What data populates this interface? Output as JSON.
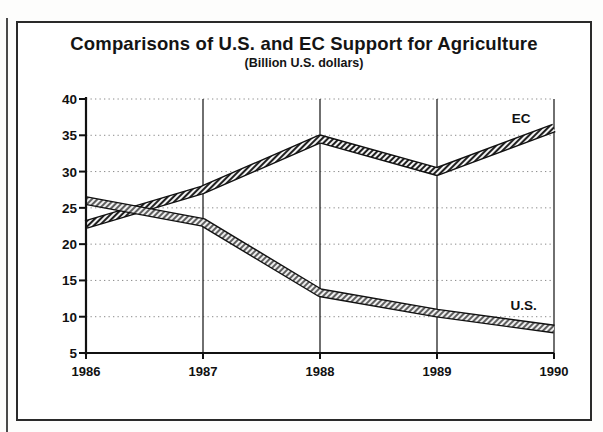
{
  "figure": {
    "title": "Comparisons of U.S. and EC Support for Agriculture",
    "subtitle": "(Billion U.S. dollars)"
  },
  "colors": {
    "ink": "#141414",
    "frame": "#2a2a2a",
    "axis": "#111111",
    "gridline": "#8a8a8a",
    "series_ec": "#1c1c1c",
    "series_us": "#5a5a5a"
  },
  "chart_data": {
    "type": "line",
    "title": "Comparisons of U.S. and EC Support for Agriculture",
    "subtitle": "(Billion U.S. dollars)",
    "xlabel": "",
    "ylabel": "",
    "categories": [
      "1986",
      "1987",
      "1988",
      "1989",
      "1990"
    ],
    "x": [
      1986,
      1987,
      1988,
      1989,
      1990
    ],
    "xlim": [
      1986,
      1990
    ],
    "ylim": [
      5,
      40
    ],
    "yticks": [
      5,
      10,
      15,
      20,
      25,
      30,
      35,
      40
    ],
    "xticks": [
      "1986",
      "1987",
      "1988",
      "1989",
      "1990"
    ],
    "grid": true,
    "grid_style": "dotted-horizontal-and-solid-vertical",
    "legend": "inline-end-labels",
    "series": [
      {
        "name": "EC",
        "label": "EC",
        "values": [
          22.7,
          27.5,
          34.5,
          30.0,
          36.0
        ],
        "label_position": {
          "x": 1989.72,
          "y": 37.4
        }
      },
      {
        "name": "U.S.",
        "label": "U.S.",
        "values": [
          26.0,
          23.0,
          13.3,
          10.5,
          8.3
        ],
        "label_position": {
          "x": 1989.74,
          "y": 11.6
        }
      }
    ]
  }
}
